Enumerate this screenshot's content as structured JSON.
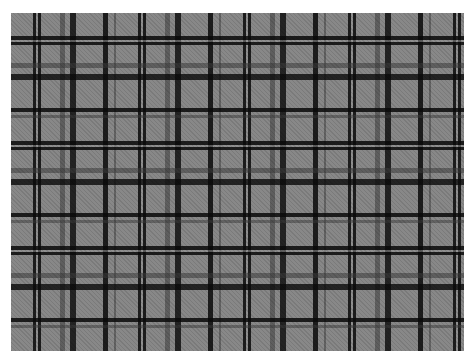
{
  "image": {
    "subject": "gray tartan plaid fabric",
    "colors": {
      "background": "#ffffff",
      "base": "#888888",
      "dark_stripe": "#0a0a0a",
      "mid_stripe": "#3c3c3c",
      "light_thread": "#969696"
    },
    "sett_px": 105
  }
}
